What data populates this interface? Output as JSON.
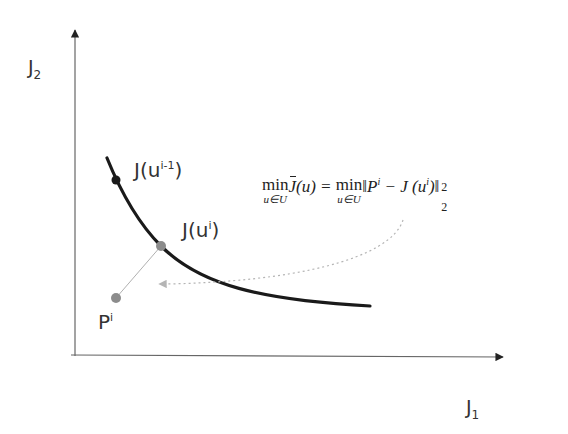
{
  "diagram": {
    "type": "pareto-front-projection",
    "axes": {
      "x_label": {
        "main": "J",
        "sub": "1"
      },
      "y_label": {
        "main": "J",
        "sub": "2"
      }
    },
    "points": [
      {
        "id": "prev",
        "label_main": "J(u",
        "label_sup": "i-1",
        "label_end": ")",
        "color": "#1a1a1a"
      },
      {
        "id": "current",
        "label_main": "J(u",
        "label_sup": "i",
        "label_end": ")",
        "color": "#8c8c8c"
      },
      {
        "id": "reference",
        "label_main": "P",
        "label_sup": "i",
        "label_end": "",
        "color": "#8c8c8c"
      }
    ],
    "formula": {
      "lhs_op": "min",
      "lhs_under": "u∈U",
      "lhs_func": "J",
      "lhs_arg": "(u) =",
      "rhs_op": "min",
      "rhs_under": "u∈U",
      "rhs_open": "‖P",
      "rhs_P_sup": "i",
      "rhs_mid": " − J (u",
      "rhs_u_sup": "i",
      "rhs_close": ")‖",
      "norm_sup": "2",
      "norm_sub": "2"
    },
    "colors": {
      "axis": "#555555",
      "curve": "#1a1a1a",
      "projection_line": "#b0b0b0",
      "dotted_arrow": "#b5b5b5"
    }
  }
}
